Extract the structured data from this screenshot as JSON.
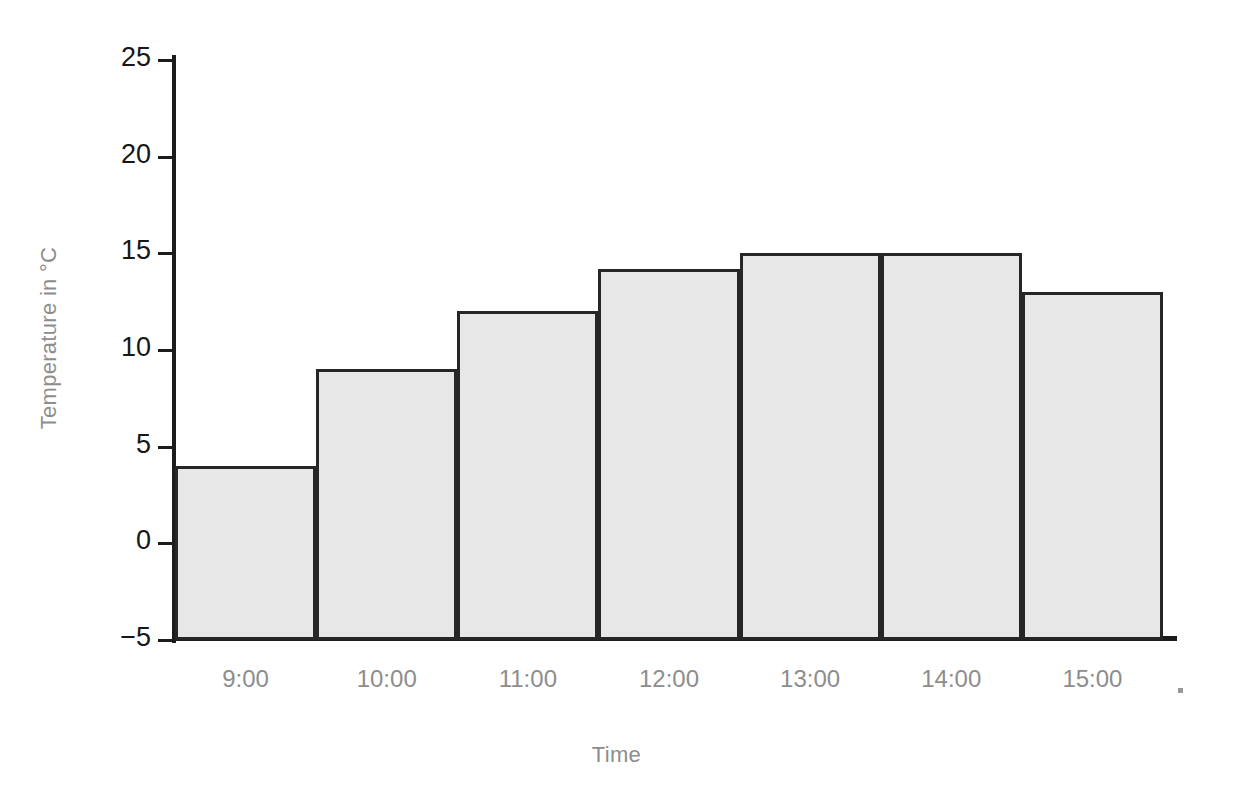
{
  "chart_data": {
    "type": "bar",
    "title": "",
    "subtitle": "",
    "xlabel": "Time",
    "ylabel": "Temperature in °C",
    "categories": [
      "9:00",
      "10:00",
      "11:00",
      "12:00",
      "13:00",
      "14:00",
      "15:00"
    ],
    "values": [
      4,
      9,
      12,
      14.2,
      15,
      15,
      13
    ],
    "series": [
      {
        "name": "Temperature",
        "values": [
          4,
          9,
          12,
          14.2,
          15,
          15,
          13
        ]
      }
    ],
    "ylim": [
      -5,
      25
    ],
    "xlim": [
      0,
      7
    ],
    "ytick_labels": [
      "25",
      "20",
      "15",
      "10",
      "5",
      "0",
      "−5"
    ],
    "ytick_values": [
      25,
      20,
      15,
      10,
      5,
      0,
      -5
    ],
    "grid": false,
    "legend": null,
    "legend_position": "none",
    "bar_gap": 0,
    "colors": {
      "bar_fill": "#e7e7e7",
      "bar_edge": "#262626",
      "axis_line": "#1c1c1c",
      "tick_label": "#171717",
      "axis_title": "#8d8d8d",
      "x_tick_label": "#8d8d8d",
      "background": "#ffffff"
    },
    "annotations": []
  }
}
